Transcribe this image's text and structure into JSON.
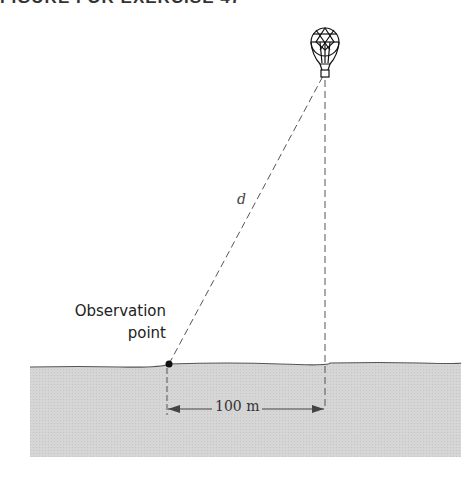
{
  "header": {
    "title": "FIGURE FOR EXERCISE 47"
  },
  "diagram": {
    "observation_label_line1": "Observation",
    "observation_label_line2": "point",
    "distance_label": "d",
    "baseline_label": "100 m"
  },
  "colors": {
    "ground_fill": "#d4d4d4",
    "line": "#555555",
    "point": "#111111"
  }
}
